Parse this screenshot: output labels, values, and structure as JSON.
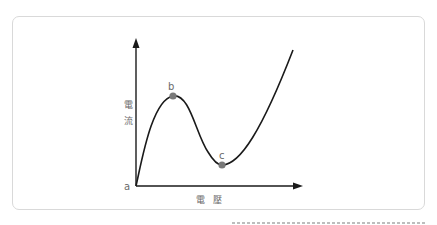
{
  "figure": {
    "y_axis_label": "電流",
    "y_axis_chars": [
      "電",
      "流"
    ],
    "x_axis_label": "電壓",
    "origin_label": "a",
    "points": [
      {
        "label": "b",
        "description": "local maximum (peak current)"
      },
      {
        "label": "c",
        "description": "local minimum (valley current)"
      }
    ],
    "curve_description": "N-shaped I-V curve: rises from origin a to peak b, falls to valley c, then rises steeply",
    "colors": {
      "curve": "#1a1a1a",
      "axis": "#1a1a1a",
      "point": "#7a7a7a",
      "label": "#6b6b6b",
      "card_border": "#d9d9d9"
    }
  },
  "caption": {
    "text": ""
  }
}
